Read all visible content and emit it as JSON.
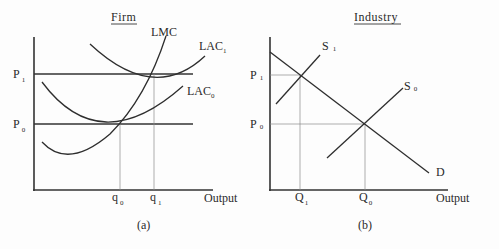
{
  "figure": {
    "panels": [
      {
        "id": "a",
        "title": "Firm",
        "caption": "(a)",
        "x_axis_label": "Output",
        "price_levels": [
          {
            "main": "P",
            "sub": "1"
          },
          {
            "main": "P",
            "sub": "0"
          }
        ],
        "quantity_marks": [
          {
            "main": "q",
            "sub": "0"
          },
          {
            "main": "q",
            "sub": "1"
          }
        ],
        "curves": [
          {
            "main": "LMC",
            "sub": ""
          },
          {
            "main": "LAC",
            "sub": "1"
          },
          {
            "main": "LAC",
            "sub": "0"
          }
        ]
      },
      {
        "id": "b",
        "title": "Industry",
        "caption": "(b)",
        "x_axis_label": "Output",
        "price_levels": [
          {
            "main": "P",
            "sub": "1"
          },
          {
            "main": "P",
            "sub": "0"
          }
        ],
        "quantity_marks": [
          {
            "main": "Q",
            "sub": "1"
          },
          {
            "main": "Q",
            "sub": "0"
          }
        ],
        "curves": [
          {
            "main": "S",
            "sub": "1"
          },
          {
            "main": "S",
            "sub": "0"
          },
          {
            "main": "D",
            "sub": ""
          }
        ]
      }
    ]
  }
}
